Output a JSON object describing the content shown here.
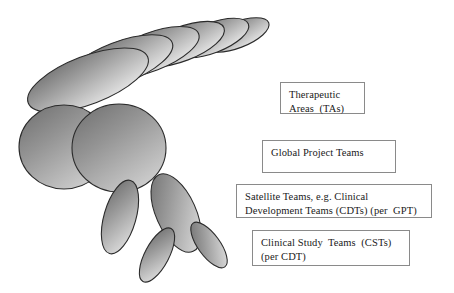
{
  "diagram": {
    "background_color": "#ffffff",
    "shape_stroke_color": "#2b2b2b",
    "shape_fill_dark": "#6e6e6e",
    "shape_fill_light": "#d6d6d6",
    "box_border_color": "#8a8a8a",
    "text_color": "#1a1a1a"
  },
  "callouts": [
    {
      "id": "tas",
      "lines": [
        "Therapeutic",
        "Areas  (TAs)"
      ]
    },
    {
      "id": "gpt",
      "lines": [
        "Global Project Teams"
      ]
    },
    {
      "id": "satellite",
      "lines": [
        "Satellite Teams, e.g. Clinical",
        "Development Teams (CDTs) (per  GPT)"
      ]
    },
    {
      "id": "cst",
      "lines": [
        "Clinical Study  Teams  (CSTs)",
        "(per CDT)"
      ]
    }
  ],
  "shapes": {
    "cascade_ellipses": [
      {
        "cx": 237,
        "cy": 35,
        "rx": 34,
        "ry": 13,
        "rot": -21
      },
      {
        "cx": 212,
        "cy": 38,
        "rx": 39,
        "ry": 15,
        "rot": -21
      },
      {
        "cx": 182,
        "cy": 44,
        "rx": 45,
        "ry": 17,
        "rot": -21
      },
      {
        "cx": 151,
        "cy": 52,
        "rx": 51,
        "ry": 19,
        "rot": -21
      },
      {
        "cx": 119,
        "cy": 63,
        "rx": 57,
        "ry": 21,
        "rot": -21
      },
      {
        "cx": 88,
        "cy": 80,
        "rx": 64,
        "ry": 24,
        "rot": -21
      }
    ],
    "large_circles": [
      {
        "cx": 64,
        "cy": 147,
        "rx": 45,
        "ry": 42,
        "rot": 0
      },
      {
        "cx": 119,
        "cy": 148,
        "rx": 47,
        "ry": 44,
        "rot": 0
      }
    ],
    "small_ellipses": [
      {
        "cx": 120,
        "cy": 217,
        "rx": 16,
        "ry": 38,
        "rot": 16
      },
      {
        "cx": 176,
        "cy": 213,
        "rx": 20,
        "ry": 42,
        "rot": -24
      },
      {
        "cx": 157,
        "cy": 255,
        "rx": 12,
        "ry": 30,
        "rot": 28
      },
      {
        "cx": 209,
        "cy": 245,
        "rx": 11,
        "ry": 27,
        "rot": -36
      }
    ]
  }
}
